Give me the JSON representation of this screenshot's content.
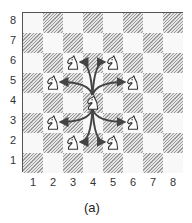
{
  "diagram": {
    "caption": "(a)",
    "ranks": [
      "8",
      "7",
      "6",
      "5",
      "4",
      "3",
      "2",
      "1"
    ],
    "files": [
      "1",
      "2",
      "3",
      "4",
      "5",
      "6",
      "7",
      "8"
    ],
    "center_knight": {
      "file": 4,
      "rank": 4
    },
    "target_knights": [
      {
        "file": 3,
        "rank": 6
      },
      {
        "file": 5,
        "rank": 6
      },
      {
        "file": 2,
        "rank": 5
      },
      {
        "file": 6,
        "rank": 5
      },
      {
        "file": 2,
        "rank": 3
      },
      {
        "file": 6,
        "rank": 3
      },
      {
        "file": 3,
        "rank": 2
      },
      {
        "file": 5,
        "rank": 2
      }
    ],
    "colors": {
      "dark_hatch": "#9a9a9a",
      "light": "#f8f8f8",
      "arrow": "#444444",
      "border": "#555555"
    }
  }
}
